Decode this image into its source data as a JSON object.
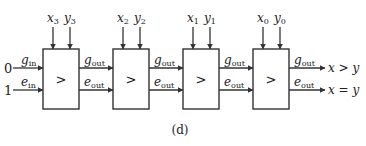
{
  "diagram": {
    "caption": "(d)",
    "inputs": {
      "g_in_value": "0",
      "e_in_value": "1",
      "g_in_label": "g",
      "g_in_sub": "in",
      "e_in_label": "e",
      "e_in_sub": "in"
    },
    "blocks": [
      {
        "symbol": ">",
        "x_label": "x",
        "x_sub": "3",
        "y_label": "y",
        "y_sub": "3",
        "g_out": "g",
        "g_out_sub": "out",
        "e_out": "e",
        "e_out_sub": "out"
      },
      {
        "symbol": ">",
        "x_label": "x",
        "x_sub": "2",
        "y_label": "y",
        "y_sub": "2",
        "g_out": "g",
        "g_out_sub": "out",
        "e_out": "e",
        "e_out_sub": "out"
      },
      {
        "symbol": ">",
        "x_label": "x",
        "x_sub": "1",
        "y_label": "y",
        "y_sub": "1",
        "g_out": "g",
        "g_out_sub": "out",
        "e_out": "e",
        "e_out_sub": "out"
      },
      {
        "symbol": ">",
        "x_label": "x",
        "x_sub": "0",
        "y_label": "y",
        "y_sub": "0",
        "g_out": "g",
        "g_out_sub": "out",
        "e_out": "e",
        "e_out_sub": "out"
      }
    ],
    "outputs": {
      "greater": "x > y",
      "equal": "x = y"
    }
  }
}
